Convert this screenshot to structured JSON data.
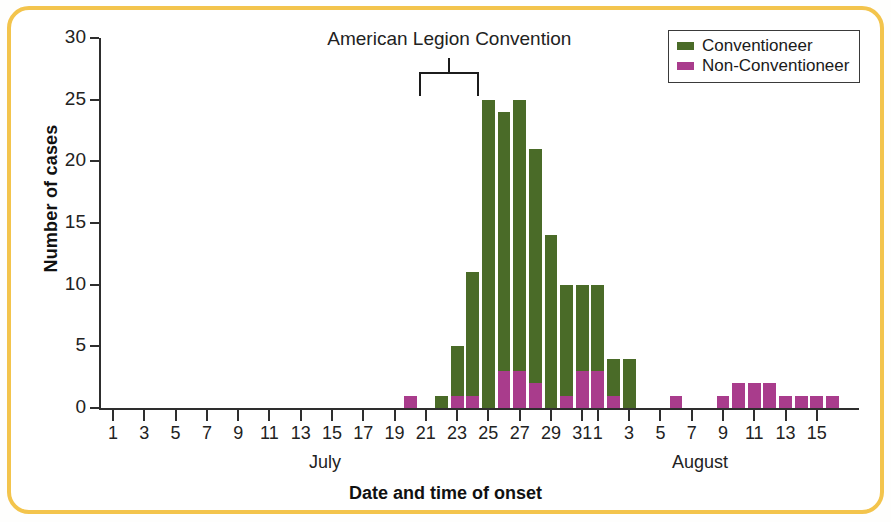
{
  "figure": {
    "frame_color": "#f3c44c"
  },
  "annotation": {
    "label": "American Legion Convention"
  },
  "legend": {
    "items": [
      {
        "label": "Conventioneer",
        "color": "#4a6b28"
      },
      {
        "label": "Non-Conventioneer",
        "color": "#a93c8c"
      }
    ]
  },
  "axes": {
    "y_title": "Number of cases",
    "x_title": "Date and time of onset",
    "y_ticks": [
      "0",
      "5",
      "10",
      "15",
      "20",
      "25",
      "30"
    ],
    "month_labels": [
      "July",
      "August"
    ],
    "x_tick_labels": [
      "1",
      "3",
      "5",
      "7",
      "9",
      "11",
      "13",
      "15",
      "17",
      "19",
      "21",
      "23",
      "25",
      "27",
      "29",
      "31",
      "2",
      "4",
      "6",
      "8",
      "10",
      "12",
      "14",
      "16"
    ]
  },
  "chart_data": {
    "type": "bar",
    "title": "American Legion Convention",
    "xlabel": "Date and time of onset",
    "ylabel": "Number of cases",
    "ylim": [
      0,
      30
    ],
    "ytick_step": 5,
    "grid": false,
    "legend_position": "top-right",
    "stacked": true,
    "categories": [
      "Jul 1",
      "Jul 2",
      "Jul 3",
      "Jul 4",
      "Jul 5",
      "Jul 6",
      "Jul 7",
      "Jul 8",
      "Jul 9",
      "Jul 10",
      "Jul 11",
      "Jul 12",
      "Jul 13",
      "Jul 14",
      "Jul 15",
      "Jul 16",
      "Jul 17",
      "Jul 18",
      "Jul 19",
      "Jul 20",
      "Jul 21",
      "Jul 22",
      "Jul 23",
      "Jul 24",
      "Jul 25",
      "Jul 26",
      "Jul 27",
      "Jul 28",
      "Jul 29",
      "Jul 30",
      "Jul 31",
      "Aug 1",
      "Aug 2",
      "Aug 3",
      "Aug 4",
      "Aug 5",
      "Aug 6",
      "Aug 7",
      "Aug 8",
      "Aug 9",
      "Aug 10",
      "Aug 11",
      "Aug 12",
      "Aug 13",
      "Aug 14",
      "Aug 15",
      "Aug 16"
    ],
    "series": [
      {
        "name": "Non-Conventioneer",
        "color": "#a93c8c",
        "values": [
          0,
          0,
          0,
          0,
          0,
          0,
          0,
          0,
          0,
          0,
          0,
          0,
          0,
          0,
          0,
          0,
          0,
          0,
          0,
          1,
          0,
          0,
          1,
          1,
          0,
          3,
          3,
          2,
          0,
          1,
          3,
          3,
          1,
          0,
          0,
          0,
          1,
          0,
          0,
          1,
          2,
          2,
          2,
          1,
          1,
          1,
          1
        ]
      },
      {
        "name": "Conventioneer",
        "color": "#4a6b28",
        "values": [
          0,
          0,
          0,
          0,
          0,
          0,
          0,
          0,
          0,
          0,
          0,
          0,
          0,
          0,
          0,
          0,
          0,
          0,
          0,
          0,
          0,
          1,
          4,
          10,
          25,
          21,
          22,
          19,
          14,
          9,
          7,
          7,
          3,
          4,
          0,
          0,
          0,
          0,
          0,
          0,
          0,
          0,
          0,
          0,
          0,
          0,
          0
        ]
      }
    ],
    "totals": [
      0,
      0,
      0,
      0,
      0,
      0,
      0,
      0,
      0,
      0,
      0,
      0,
      0,
      0,
      0,
      0,
      0,
      0,
      0,
      1,
      0,
      1,
      5,
      11,
      25,
      24,
      25,
      21,
      14,
      10,
      10,
      10,
      4,
      4,
      0,
      0,
      1,
      0,
      0,
      1,
      2,
      2,
      2,
      1,
      1,
      1,
      1
    ],
    "annotations": [
      {
        "text": "American Legion Convention",
        "span": [
          "Jul 21",
          "Jul 24"
        ]
      }
    ]
  }
}
